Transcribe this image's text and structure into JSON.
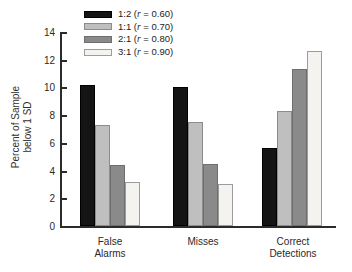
{
  "figure": {
    "background": "#ffffff",
    "axis_color": "#2b2b2b"
  },
  "y_axis": {
    "title_line1": "Percent of Sample",
    "title_line2": "below 1 SD",
    "tick_labels": [
      "0",
      "2",
      "4",
      "6",
      "8",
      "10",
      "12",
      "14"
    ]
  },
  "x_axis": {
    "categories": [
      {
        "line1": "False",
        "line2": "Alarms"
      },
      {
        "line1": "Misses",
        "line2": ""
      },
      {
        "line1": "Correct",
        "line2": "Detections"
      }
    ]
  },
  "legend": {
    "items": [
      {
        "pre": "1:2 (",
        "r_symbol": "r",
        "post": " = 0.60)",
        "swatch_color": "#141414",
        "swatch_border": "#000000"
      },
      {
        "pre": "1:1 (",
        "r_symbol": "r",
        "post": " = 0.70)",
        "swatch_color": "#bfbfbf",
        "swatch_border": "#8c8c8c"
      },
      {
        "pre": "2:1 (",
        "r_symbol": "r",
        "post": " = 0.80)",
        "swatch_color": "#8a8a8a",
        "swatch_border": "#6e6e6e"
      },
      {
        "pre": "3:1 (",
        "r_symbol": "r",
        "post": " = 0.90)",
        "swatch_color": "#f4f3ef",
        "swatch_border": "#9c9c9c"
      }
    ]
  },
  "chart_data": {
    "type": "bar",
    "categories": [
      "False Alarms",
      "Misses",
      "Correct Detections"
    ],
    "series": [
      {
        "name": "1:2 (r = 0.60)",
        "color": "#141414",
        "border": "#000000",
        "values": [
          10.2,
          10.0,
          5.6
        ]
      },
      {
        "name": "1:1 (r = 0.70)",
        "color": "#bfbfbf",
        "border": "#8c8c8c",
        "values": [
          7.3,
          7.5,
          8.3
        ]
      },
      {
        "name": "2:1 (r = 0.80)",
        "color": "#8a8a8a",
        "border": "#6e6e6e",
        "values": [
          4.4,
          4.5,
          11.3
        ]
      },
      {
        "name": "3:1 (r = 0.90)",
        "color": "#f4f3ef",
        "border": "#9c9c9c",
        "values": [
          3.2,
          3.0,
          12.6
        ]
      }
    ],
    "title": "",
    "xlabel": "",
    "ylabel": "Percent of Sample below 1 SD",
    "ylim": [
      0,
      14
    ],
    "yticks": [
      0,
      2,
      4,
      6,
      8,
      10,
      12,
      14
    ],
    "legend_position": "top-left",
    "grid": false
  }
}
